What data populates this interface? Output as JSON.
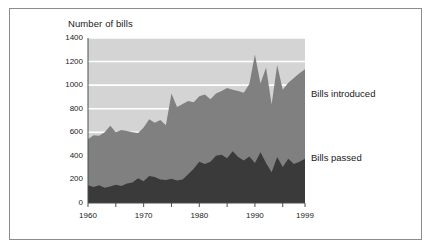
{
  "figure": {
    "axis_title": "Number of bills",
    "border_color": "#8c8c8c",
    "background": "#ffffff"
  },
  "labels": {
    "introduced": "Bills introduced",
    "passed": "Bills passed"
  },
  "colors": {
    "plot_background": "#d4d4d4",
    "gridline": "#ffffff",
    "introduced_fill": "#808080",
    "passed_fill": "#3a3a3a",
    "axis": "#4d4d4d",
    "text": "#1a1a1a"
  },
  "chart_data": {
    "type": "area",
    "title": "",
    "subtitle": "",
    "xlabel": "",
    "ylabel": "Number of bills",
    "ylim": [
      0,
      1400
    ],
    "xlim": [
      1960,
      1999
    ],
    "grid": true,
    "gridlines_y": [
      200,
      400,
      600,
      800,
      1000,
      1200,
      1400
    ],
    "legend_position": "right-inline",
    "yticks": [
      0,
      200,
      400,
      600,
      800,
      1000,
      1200,
      1400
    ],
    "ytick_labels": [
      "0",
      "200",
      "400",
      "600",
      "800",
      "1000",
      "1200",
      "1400"
    ],
    "xticks": [
      1960,
      1965,
      1970,
      1975,
      1980,
      1985,
      1990,
      1995,
      1999
    ],
    "xtick_labels_shown": [
      "1960",
      "1970",
      "1980",
      "1990",
      "1999"
    ],
    "x": [
      1960,
      1961,
      1962,
      1963,
      1964,
      1965,
      1966,
      1967,
      1968,
      1969,
      1970,
      1971,
      1972,
      1973,
      1974,
      1975,
      1976,
      1977,
      1978,
      1979,
      1980,
      1981,
      1982,
      1983,
      1984,
      1985,
      1986,
      1987,
      1988,
      1989,
      1990,
      1991,
      1992,
      1993,
      1994,
      1995,
      1996,
      1997,
      1998,
      1999
    ],
    "series": [
      {
        "name": "Bills introduced",
        "color": "#808080",
        "stacked": false,
        "values": [
          540,
          575,
          570,
          600,
          655,
          600,
          620,
          610,
          600,
          595,
          640,
          710,
          680,
          705,
          660,
          930,
          815,
          840,
          865,
          855,
          905,
          920,
          880,
          930,
          950,
          975,
          960,
          950,
          935,
          1010,
          1260,
          1015,
          1150,
          835,
          1170,
          960,
          1020,
          1060,
          1100,
          1135
        ]
      },
      {
        "name": "Bills passed",
        "color": "#3a3a3a",
        "stacked": false,
        "values": [
          150,
          135,
          150,
          130,
          140,
          155,
          145,
          165,
          175,
          210,
          185,
          230,
          220,
          200,
          195,
          205,
          190,
          200,
          245,
          290,
          350,
          330,
          350,
          400,
          410,
          380,
          440,
          390,
          360,
          395,
          340,
          430,
          340,
          260,
          390,
          305,
          375,
          330,
          350,
          375
        ]
      }
    ],
    "annotations": [
      {
        "text": "Bills introduced",
        "x": 1999,
        "y": 1080
      },
      {
        "text": "Bills passed",
        "x": 1999,
        "y": 400
      }
    ]
  }
}
